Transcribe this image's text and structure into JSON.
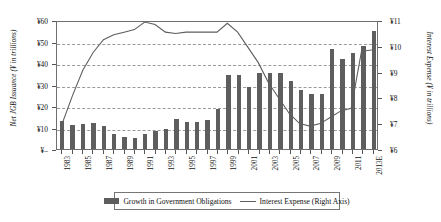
{
  "chart_data": {
    "type": "bar",
    "title": "",
    "xlabel": "",
    "ylabel": "Net JGB Issuance (¥ in trillions)",
    "y2label": "Interest Expense (¥ in trillions)",
    "grid": true,
    "legend_position": "bottom",
    "ylim": [
      0,
      60
    ],
    "y2lim": [
      6,
      11
    ],
    "ytick_labels": [
      "¥–",
      "¥10",
      "¥20",
      "¥30",
      "¥40",
      "¥50",
      "¥60"
    ],
    "ytick_values": [
      0,
      10,
      20,
      30,
      40,
      50,
      60
    ],
    "y2tick_labels": [
      "¥6",
      "¥7",
      "¥8",
      "¥9",
      "¥10",
      "¥11"
    ],
    "y2tick_values": [
      6,
      7,
      8,
      9,
      10,
      11
    ],
    "categories": [
      "1983",
      "1984",
      "1985",
      "1986",
      "1987",
      "1988",
      "1989",
      "1990",
      "1991",
      "1992",
      "1993",
      "1994",
      "1995",
      "1996",
      "1997",
      "1998",
      "1999",
      "2000",
      "2001",
      "2002",
      "2003",
      "2004",
      "2005",
      "2006",
      "2007",
      "2008",
      "2009",
      "2010",
      "2011",
      "2012",
      "2013E"
    ],
    "xtick_labels": [
      "1983",
      "1985",
      "1987",
      "1989",
      "1991",
      "1993",
      "1995",
      "1997",
      "1999",
      "2001",
      "2003",
      "2005",
      "2007",
      "2009",
      "2011",
      "2013E"
    ],
    "series": [
      {
        "name": "Growth in Government Obligations",
        "axis": "left",
        "type": "bar",
        "color": "#5e5e5e",
        "values": [
          12.8,
          11.2,
          11.5,
          11.9,
          10.5,
          7.2,
          5.4,
          5.0,
          6.8,
          8.5,
          9.5,
          14.0,
          12.6,
          12.4,
          13.5,
          18.5,
          34.5,
          34.2,
          29.0,
          35.5,
          35.5,
          35.5,
          31.5,
          27.5,
          25.5,
          25.8,
          46.5,
          11.5,
          4.0,
          5.5,
          3.5
        ],
        "values_note": "bar heights read against left axis"
      },
      {
        "name": "Interest Expense (Right Axis)",
        "axis": "right",
        "type": "line",
        "color": "#5e5e5e",
        "values": [
          7.0,
          8.1,
          9.1,
          9.8,
          10.3,
          10.5,
          10.6,
          10.7,
          11.0,
          10.9,
          10.6,
          10.55,
          10.6,
          10.6,
          10.6,
          10.6,
          10.9,
          10.6,
          10.0,
          9.4,
          8.6,
          8.0,
          7.4,
          7.0,
          6.9,
          7.2,
          7.4,
          7.8,
          7.8,
          7.8,
          7.8
        ]
      }
    ],
    "bar_values_final": [
      12.8,
      11.2,
      11.5,
      11.9,
      10.5,
      7.2,
      5.4,
      5.0,
      6.8,
      8.5,
      9.5,
      14.0,
      12.6,
      12.4,
      13.5,
      18.5,
      34.5,
      34.2,
      29.0,
      35.5,
      35.5,
      35.5,
      31.5,
      27.5,
      25.5,
      25.8,
      46.5,
      42.0,
      44.5,
      48.0,
      55.0
    ],
    "line_values_final": [
      7.0,
      8.1,
      9.1,
      9.8,
      10.3,
      10.5,
      10.6,
      10.7,
      11.0,
      10.9,
      10.6,
      10.55,
      10.6,
      10.6,
      10.6,
      10.6,
      10.95,
      10.6,
      10.0,
      9.4,
      8.6,
      8.0,
      7.4,
      7.0,
      6.9,
      7.0,
      7.25,
      7.5,
      7.6,
      9.85,
      9.9
    ]
  },
  "legend": {
    "bar_label": "Growth in Government Obligations",
    "line_label": "Interest Expense (Right Axis)"
  },
  "axes": {
    "left_title": "Net JGB Issuance (¥ in trillions)",
    "right_title": "Interest Expense (¥ in trillions)"
  },
  "colors": {
    "bar": "#5e5e5e",
    "line": "#5e5e5e",
    "grid": "#9a9a9a",
    "axis": "#6f6f6f",
    "text": "#111111"
  }
}
